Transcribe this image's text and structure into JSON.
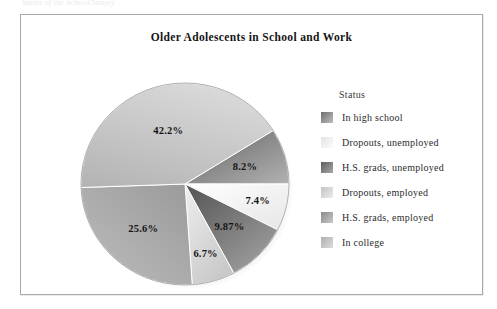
{
  "scan": {
    "top_cropped_text": "Status of the School/Sanjay"
  },
  "frame": {
    "border_color": "#a9a9ad"
  },
  "chart_title": "Older Adolescents in School and Work",
  "legend": {
    "title": "Status",
    "items": [
      {
        "label": "In high school",
        "color": "#8e8e8e",
        "swatch_from": "#6f6f6f",
        "swatch_to": "#bdbdbd"
      },
      {
        "label": "Dropouts, unemployed",
        "color": "#f2f2f2",
        "swatch_from": "#e4e4e4",
        "swatch_to": "#fbfbfb"
      },
      {
        "label": "H.S. grads, unemployed",
        "color": "#7b7b7b",
        "swatch_from": "#5d5d5d",
        "swatch_to": "#a8a8a8"
      },
      {
        "label": "Dropouts, employed",
        "color": "#d6d6d6",
        "swatch_from": "#c3c3c3",
        "swatch_to": "#ededed"
      },
      {
        "label": "H.S. grads, employed",
        "color": "#a6a6a6",
        "swatch_from": "#8a8a8a",
        "swatch_to": "#c9c9c9"
      },
      {
        "label": "In college",
        "color": "#c2c2c2",
        "swatch_from": "#b0b0b0",
        "swatch_to": "#dcdcdc"
      }
    ]
  },
  "chart_data": {
    "type": "pie",
    "title": "Older Adolescents in School and Work",
    "legend_title": "Status",
    "legend_position": "right",
    "units": "percent",
    "categories": [
      "In high school",
      "Dropouts, unemployed",
      "H.S. grads, unemployed",
      "Dropouts, employed",
      "H.S. grads, employed",
      "In college"
    ],
    "values": [
      8.2,
      7.4,
      9.87,
      6.7,
      25.6,
      42.2
    ],
    "labels": [
      "8.2%",
      "7.4%",
      "9.87%",
      "6.7%",
      "25.6%",
      "42.2%"
    ],
    "colors": [
      "#8e8e8e",
      "#f2f2f2",
      "#7b7b7b",
      "#d6d6d6",
      "#a6a6a6",
      "#c2c2c2"
    ],
    "slices": [
      {
        "label": "In high school",
        "value": 8.2,
        "display": "8.2%",
        "start_deg": -32,
        "end_deg": 0,
        "color": "#8e8e8e"
      },
      {
        "label": "Dropouts, unemployed",
        "value": 7.4,
        "display": "7.4%",
        "start_deg": 0,
        "end_deg": 27,
        "color": "#f2f2f2"
      },
      {
        "label": "H.S. grads, unemployed",
        "value": 9.87,
        "display": "9.87%",
        "start_deg": 27,
        "end_deg": 62,
        "color": "#7b7b7b"
      },
      {
        "label": "Dropouts, employed",
        "value": 6.7,
        "display": "6.7%",
        "start_deg": 62,
        "end_deg": 86,
        "color": "#d6d6d6"
      },
      {
        "label": "H.S. grads, employed",
        "value": 25.6,
        "display": "25.6%",
        "start_deg": 86,
        "end_deg": 178,
        "color": "#a6a6a6"
      },
      {
        "label": "In college",
        "value": 42.2,
        "display": "42.2%",
        "start_deg": 178,
        "end_deg": 328,
        "color": "#c2c2c2"
      }
    ],
    "total": 99.97,
    "has_shadow": true,
    "grid": false
  }
}
